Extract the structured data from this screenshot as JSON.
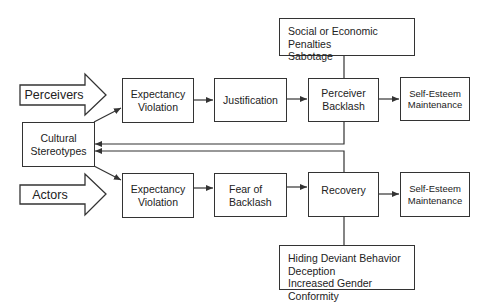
{
  "diagram": {
    "inputs": {
      "perceivers": "Perceivers",
      "actors": "Actors"
    },
    "cultural_stereotypes": [
      "Cultural",
      "Stereotypes"
    ],
    "perceiver_path": {
      "expectancy_violation": [
        "Expectancy",
        "Violation"
      ],
      "justification": "Justification",
      "perceiver_backlash": [
        "Perceiver",
        "Backlash"
      ],
      "self_esteem": [
        "Self-Esteem",
        "Maintenance"
      ],
      "consequences": [
        "Social or Economic Penalties",
        "Sabotage"
      ]
    },
    "actor_path": {
      "expectancy_violation": [
        "Expectancy",
        "Violation"
      ],
      "fear_of_backlash": [
        "Fear of",
        "Backlash"
      ],
      "recovery": "Recovery",
      "self_esteem": [
        "Self-Esteem",
        "Maintenance"
      ],
      "strategies": [
        "Hiding Deviant Behavior",
        "Deception",
        "Increased Gender Conformity"
      ]
    }
  },
  "colors": {
    "stroke": "#333333",
    "background": "#ffffff",
    "text": "#222222"
  }
}
